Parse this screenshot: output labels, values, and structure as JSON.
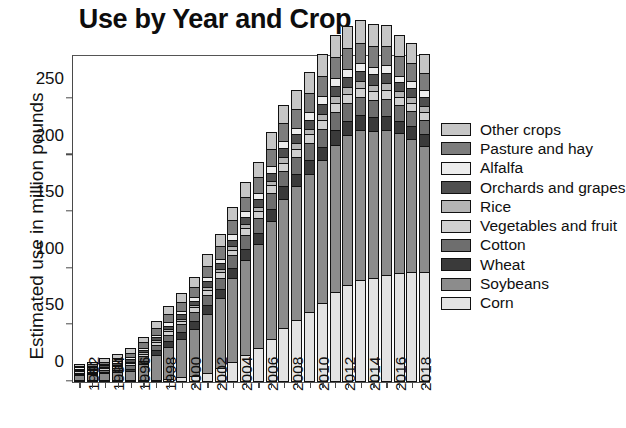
{
  "chart_data": {
    "type": "bar",
    "subtype": "stacked-bar",
    "title": "Use by Year and Crop",
    "xlabel": "",
    "ylabel": "Estimated use in million pounds",
    "ylim": [
      0,
      290
    ],
    "yticks": [
      0,
      50,
      100,
      150,
      200,
      250
    ],
    "ytick_labels": [
      "0",
      "50",
      "100",
      "150",
      "200",
      "250"
    ],
    "grid": "horizontal-and-vertical-white",
    "legend_position": "right",
    "categories": [
      "1992",
      "1993",
      "1994",
      "1995",
      "1996",
      "1997",
      "1998",
      "1999",
      "2000",
      "2001",
      "2002",
      "2003",
      "2004",
      "2005",
      "2006",
      "2007",
      "2008",
      "2009",
      "2010",
      "2011",
      "2012",
      "2013",
      "2014",
      "2015",
      "2016",
      "2017",
      "2018",
      "2019"
    ],
    "xtick_labels": [
      "1992",
      "",
      "1994",
      "",
      "1996",
      "",
      "1998",
      "",
      "2000",
      "",
      "2002",
      "",
      "2004",
      "",
      "2006",
      "",
      "2008",
      "",
      "2010",
      "",
      "2012",
      "",
      "2014",
      "",
      "2016",
      "",
      "2018",
      ""
    ],
    "series": [
      {
        "name": "Corn",
        "color": "#e3e3e3",
        "values": [
          1,
          1,
          1,
          1,
          1,
          2,
          2,
          3,
          4,
          5,
          8,
          12,
          18,
          24,
          30,
          38,
          48,
          55,
          62,
          70,
          80,
          86,
          90,
          92,
          95,
          96,
          97,
          97
        ]
      },
      {
        "name": "Soybeans",
        "color": "#8c8c8c",
        "values": [
          4,
          5,
          6,
          7,
          8,
          14,
          22,
          28,
          34,
          42,
          52,
          62,
          74,
          84,
          92,
          104,
          114,
          118,
          122,
          126,
          130,
          132,
          133,
          130,
          128,
          124,
          118,
          112
        ]
      },
      {
        "name": "Wheat",
        "color": "#3a3a3a",
        "values": [
          1,
          1,
          1,
          2,
          2,
          3,
          4,
          5,
          6,
          7,
          8,
          8,
          9,
          10,
          10,
          11,
          11,
          11,
          12,
          12,
          13,
          13,
          13,
          12,
          12,
          11,
          11,
          10
        ]
      },
      {
        "name": "Cotton",
        "color": "#6e6e6e",
        "values": [
          1,
          1,
          2,
          2,
          3,
          4,
          5,
          6,
          7,
          8,
          9,
          10,
          11,
          12,
          13,
          14,
          14,
          15,
          15,
          16,
          16,
          16,
          16,
          15,
          15,
          14,
          14,
          13
        ]
      },
      {
        "name": "Vegetables and fruit",
        "color": "#d0d0d0",
        "values": [
          1,
          1,
          1,
          1,
          2,
          2,
          2,
          3,
          3,
          4,
          4,
          5,
          5,
          6,
          6,
          7,
          7,
          7,
          8,
          8,
          8,
          8,
          8,
          8,
          8,
          7,
          7,
          7
        ]
      },
      {
        "name": "Rice",
        "color": "#b5b5b5",
        "values": [
          1,
          1,
          1,
          1,
          1,
          1,
          2,
          2,
          2,
          2,
          3,
          3,
          3,
          4,
          4,
          4,
          5,
          5,
          5,
          5,
          6,
          6,
          6,
          6,
          6,
          5,
          5,
          5
        ]
      },
      {
        "name": "Orchards and grapes",
        "color": "#4f4f4f",
        "values": [
          1,
          1,
          1,
          2,
          2,
          2,
          3,
          3,
          4,
          4,
          5,
          5,
          6,
          6,
          7,
          7,
          8,
          8,
          8,
          9,
          9,
          9,
          9,
          9,
          9,
          8,
          8,
          8
        ]
      },
      {
        "name": "Alfalfa",
        "color": "#ededed",
        "values": [
          1,
          1,
          1,
          1,
          2,
          2,
          2,
          3,
          3,
          3,
          4,
          4,
          5,
          5,
          5,
          6,
          6,
          6,
          7,
          7,
          7,
          7,
          7,
          7,
          7,
          6,
          6,
          6
        ]
      },
      {
        "name": "Pasture and hay",
        "color": "#7d7d7d",
        "values": [
          1,
          2,
          2,
          3,
          4,
          5,
          6,
          7,
          8,
          9,
          10,
          11,
          12,
          13,
          14,
          15,
          16,
          16,
          17,
          18,
          18,
          18,
          18,
          18,
          17,
          17,
          16,
          15
        ]
      },
      {
        "name": "Other crops",
        "color": "#c6c6c6",
        "values": [
          2,
          2,
          3,
          3,
          4,
          5,
          6,
          7,
          8,
          9,
          10,
          11,
          12,
          13,
          14,
          15,
          16,
          17,
          18,
          19,
          20,
          20,
          20,
          20,
          19,
          19,
          18,
          17
        ]
      }
    ],
    "totals": [
      14,
      16,
      19,
      23,
      29,
      40,
      54,
      67,
      79,
      93,
      113,
      131,
      155,
      177,
      195,
      221,
      245,
      258,
      274,
      290,
      307,
      315,
      320,
      317,
      316,
      307,
      300,
      290
    ],
    "legend_items": [
      {
        "label": "Other crops",
        "color": "#c6c6c6"
      },
      {
        "label": "Pasture and hay",
        "color": "#7d7d7d"
      },
      {
        "label": "Alfalfa",
        "color": "#ededed"
      },
      {
        "label": "Orchards and grapes",
        "color": "#4f4f4f"
      },
      {
        "label": "Rice",
        "color": "#b5b5b5"
      },
      {
        "label": "Vegetables and fruit",
        "color": "#d0d0d0"
      },
      {
        "label": "Cotton",
        "color": "#6e6e6e"
      },
      {
        "label": "Wheat",
        "color": "#3a3a3a"
      },
      {
        "label": "Soybeans",
        "color": "#8c8c8c"
      },
      {
        "label": "Corn",
        "color": "#e3e3e3"
      }
    ]
  }
}
